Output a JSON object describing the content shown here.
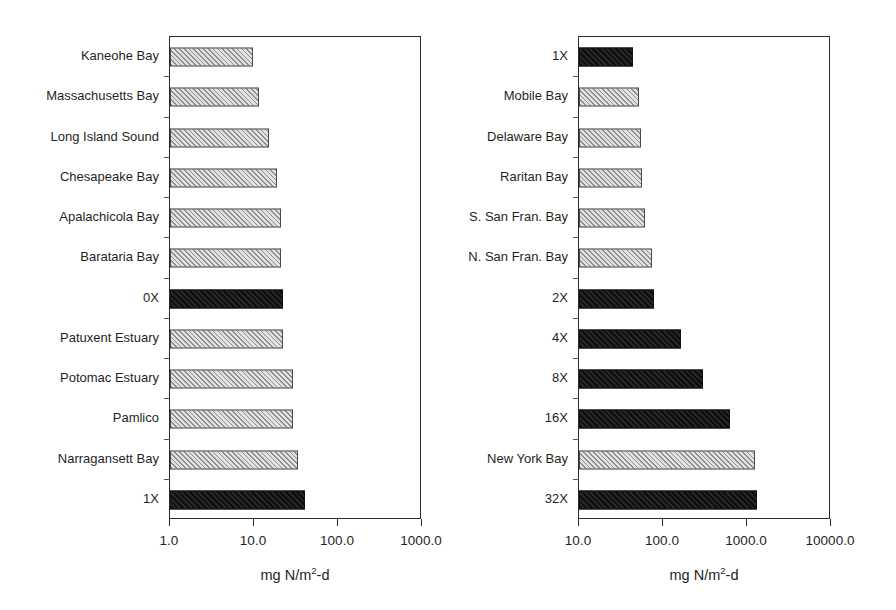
{
  "figure": {
    "background": "#ffffff",
    "hatch_color": "#8e8e8e",
    "solid_color": "#1b1b1b",
    "axis_color": "#2b2b2b"
  },
  "chart_data": [
    {
      "type": "bar",
      "orientation": "horizontal",
      "panel": "left",
      "title": "",
      "xlabel": "mg N/m2-d",
      "xlabel_display": "mg N/m",
      "xlabel_sup": "2",
      "xlabel_tail": "-d",
      "ylabel": "",
      "xscale": "log",
      "xlim": [
        1.0,
        1000.0
      ],
      "xticks": [
        1.0,
        10.0,
        100.0,
        1000.0
      ],
      "xticklabels": [
        "1.0",
        "10.0",
        "100.0",
        "1000.0"
      ],
      "grid": false,
      "legend": "none",
      "categories": [
        "Kaneohe Bay",
        "Massachusetts Bay",
        "Long Island Sound",
        "Chesapeake Bay",
        "Apalachicola Bay",
        "Barataria Bay",
        "0X",
        "Patuxent Estuary",
        "Potomac Estuary",
        "Pamlico",
        "Narragansett Bay",
        "1X"
      ],
      "values": [
        9.7,
        11.5,
        15.0,
        19.0,
        21.0,
        21.0,
        22.0,
        22.0,
        29.0,
        29.0,
        33.0,
        40.0
      ],
      "fills": [
        "hatch",
        "hatch",
        "hatch",
        "hatch",
        "hatch",
        "hatch",
        "solid",
        "hatch",
        "hatch",
        "hatch",
        "hatch",
        "solid"
      ]
    },
    {
      "type": "bar",
      "orientation": "horizontal",
      "panel": "right",
      "title": "",
      "xlabel": "mg N/m2-d",
      "xlabel_display": "mg N/m",
      "xlabel_sup": "2",
      "xlabel_tail": "-d",
      "ylabel": "",
      "xscale": "log",
      "xlim": [
        10.0,
        10000.0
      ],
      "xticks": [
        10.0,
        100.0,
        1000.0,
        10000.0
      ],
      "xticklabels": [
        "10.0",
        "100.0",
        "1000.0",
        "10000.0"
      ],
      "grid": false,
      "legend": "none",
      "categories": [
        "1X",
        "Mobile Bay",
        "Delaware Bay",
        "Raritan Bay",
        "S. San Fran. Bay",
        "N. San Fran. Bay",
        "2X",
        "4X",
        "8X",
        "16X",
        "New York Bay",
        "32X"
      ],
      "values": [
        44.0,
        52.0,
        54.0,
        57.0,
        61.0,
        73.0,
        78.0,
        165.0,
        300.0,
        620.0,
        1250.0,
        1300.0
      ],
      "fills": [
        "solid",
        "hatch",
        "hatch",
        "hatch",
        "hatch",
        "hatch",
        "solid",
        "solid",
        "solid",
        "solid",
        "hatch",
        "solid"
      ]
    }
  ]
}
